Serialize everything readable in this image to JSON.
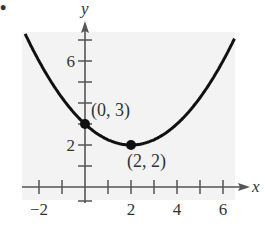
{
  "problem_marker": "•",
  "chart_data": {
    "type": "line",
    "title": "",
    "xlabel": "x",
    "ylabel": "y",
    "function": "y = (1/4)(x - 2)^2 + 2",
    "xlim": [
      -2.7,
      6.8
    ],
    "ylim": [
      0,
      7.4
    ],
    "x_ticks": [
      -2,
      -1,
      0,
      1,
      2,
      3,
      4,
      5,
      6
    ],
    "x_tick_labels": [
      "-2",
      "2",
      "4",
      "6"
    ],
    "x_tick_label_values": [
      -2,
      2,
      4,
      6
    ],
    "y_ticks": [
      1,
      2,
      3,
      4,
      5,
      6,
      7
    ],
    "y_tick_labels": [
      "2",
      "6"
    ],
    "y_tick_label_values": [
      2,
      6
    ],
    "grid": false,
    "series": [
      {
        "name": "parabola",
        "x": [
          -2.6,
          -2,
          -1,
          0,
          1,
          2,
          3,
          4,
          5,
          6,
          6.5
        ],
        "y": [
          7.29,
          6.0,
          4.25,
          3.0,
          2.25,
          2.0,
          2.25,
          3.0,
          4.25,
          6.0,
          7.06
        ]
      }
    ],
    "points": [
      {
        "x": 0,
        "y": 3,
        "label": "(0, 3)"
      },
      {
        "x": 2,
        "y": 2,
        "label": "(2, 2)"
      }
    ],
    "colors": {
      "curve": "#111111",
      "axes": "#555555",
      "background_panel": "#f3f3f3"
    }
  }
}
